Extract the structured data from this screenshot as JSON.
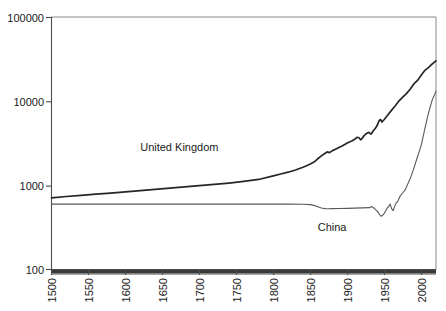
{
  "chart_data": {
    "type": "line",
    "title": "",
    "subtitle": "",
    "xlabel": "",
    "ylabel": "",
    "yscale": "log",
    "ylim": [
      100,
      100000
    ],
    "xlim": [
      1500,
      2020
    ],
    "grid": false,
    "legend_position": "inline-annotation",
    "y_ticks": [
      "100000",
      "10000",
      "1000",
      "100"
    ],
    "y_tick_values": [
      100000,
      10000,
      1000,
      100
    ],
    "x_ticks": [
      "1500",
      "1550",
      "1600",
      "1650",
      "1700",
      "1750",
      "1800",
      "1850",
      "1900",
      "1950",
      "2000"
    ],
    "x_tick_values": [
      1500,
      1550,
      1600,
      1650,
      1700,
      1750,
      1800,
      1850,
      1900,
      1950,
      2000
    ],
    "annotations": [
      {
        "text": "United Kingdom",
        "x": 1620,
        "y": 2600
      },
      {
        "text": "China",
        "x": 1860,
        "y": 290
      }
    ],
    "series": [
      {
        "name": "United Kingdom",
        "color": "#262626",
        "x": [
          1500,
          1520,
          1540,
          1560,
          1580,
          1600,
          1620,
          1640,
          1660,
          1680,
          1700,
          1720,
          1740,
          1760,
          1780,
          1800,
          1810,
          1820,
          1830,
          1840,
          1845,
          1850,
          1855,
          1860,
          1865,
          1870,
          1873,
          1876,
          1880,
          1884,
          1888,
          1890,
          1893,
          1896,
          1900,
          1903,
          1906,
          1910,
          1913,
          1916,
          1918,
          1920,
          1922,
          1925,
          1929,
          1932,
          1935,
          1938,
          1940,
          1943,
          1945,
          1947,
          1950,
          1955,
          1960,
          1965,
          1970,
          1975,
          1980,
          1985,
          1990,
          1995,
          2000,
          2005,
          2010,
          2015,
          2020
        ],
        "y": [
          714,
          740,
          762,
          788,
          812,
          840,
          868,
          900,
          930,
          962,
          995,
          1030,
          1070,
          1120,
          1180,
          1300,
          1370,
          1440,
          1530,
          1650,
          1720,
          1800,
          1900,
          2080,
          2250,
          2420,
          2510,
          2460,
          2600,
          2700,
          2820,
          2880,
          2960,
          3060,
          3200,
          3300,
          3380,
          3550,
          3750,
          3700,
          3500,
          3620,
          3850,
          4100,
          4300,
          4080,
          4450,
          4800,
          5100,
          5900,
          6100,
          5700,
          6100,
          6950,
          7900,
          8900,
          10200,
          11300,
          12400,
          14000,
          16200,
          17800,
          20500,
          23500,
          25500,
          28000,
          30500
        ]
      },
      {
        "name": "China",
        "color": "#5a5a5a",
        "x": [
          1500,
          1550,
          1600,
          1650,
          1700,
          1750,
          1800,
          1820,
          1840,
          1850,
          1855,
          1860,
          1865,
          1870,
          1875,
          1880,
          1890,
          1900,
          1910,
          1920,
          1930,
          1933,
          1936,
          1938,
          1940,
          1942,
          1944,
          1946,
          1948,
          1950,
          1952,
          1954,
          1956,
          1958,
          1960,
          1962,
          1964,
          1966,
          1968,
          1970,
          1972,
          1975,
          1978,
          1980,
          1985,
          1990,
          1995,
          2000,
          2005,
          2010,
          2015,
          2020
        ],
        "y": [
          600,
          600,
          600,
          600,
          600,
          600,
          600,
          600,
          598,
          592,
          580,
          560,
          540,
          530,
          528,
          530,
          532,
          534,
          538,
          542,
          545,
          562,
          540,
          520,
          500,
          475,
          448,
          430,
          445,
          465,
          500,
          540,
          560,
          600,
          530,
          500,
          560,
          620,
          640,
          700,
          760,
          820,
          880,
          960,
          1200,
          1600,
          2200,
          3000,
          4800,
          7400,
          10500,
          13200
        ]
      }
    ]
  }
}
